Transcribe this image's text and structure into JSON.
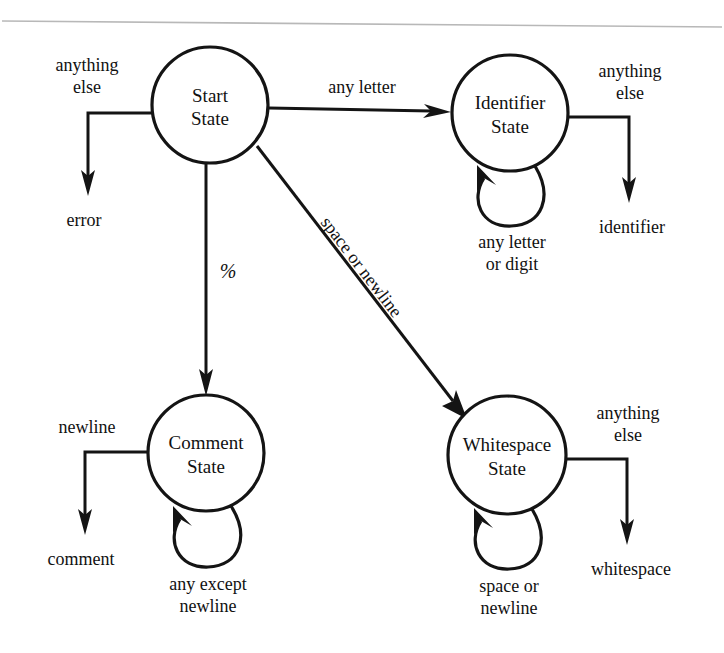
{
  "diagram": {
    "colors": {
      "stroke": "#141414",
      "background": "#ffffff",
      "rule": "#b8b8b8"
    },
    "states": [
      {
        "id": "start",
        "line1": "Start",
        "line2": "State"
      },
      {
        "id": "identifier",
        "line1": "Identifier",
        "line2": "State"
      },
      {
        "id": "comment",
        "line1": "Comment",
        "line2": "State"
      },
      {
        "id": "whitespace",
        "line1": "Whitespace",
        "line2": "State"
      }
    ],
    "transitions": [
      {
        "id": "start-to-error",
        "from": "start",
        "to": "error",
        "label_line1": "anything",
        "label_line2": "else"
      },
      {
        "id": "start-to-identifier",
        "from": "start",
        "to": "identifier",
        "label_line1": "any letter",
        "label_line2": ""
      },
      {
        "id": "start-to-comment",
        "from": "start",
        "to": "comment",
        "label_line1": "%",
        "label_line2": ""
      },
      {
        "id": "start-to-whitespace",
        "from": "start",
        "to": "whitespace",
        "label_line1": "space or",
        "label_line2": "newline"
      },
      {
        "id": "identifier-self-loop",
        "from": "identifier",
        "to": "identifier",
        "label_line1": "any letter",
        "label_line2": "or digit"
      },
      {
        "id": "identifier-to-token",
        "from": "identifier",
        "to": "identifier-token",
        "label_line1": "anything",
        "label_line2": "else"
      },
      {
        "id": "comment-self-loop",
        "from": "comment",
        "to": "comment",
        "label_line1": "any except",
        "label_line2": "newline"
      },
      {
        "id": "comment-to-token",
        "from": "comment",
        "to": "comment-token",
        "label_line1": "newline",
        "label_line2": ""
      },
      {
        "id": "whitespace-self-loop",
        "from": "whitespace",
        "to": "whitespace",
        "label_line1": "space or",
        "label_line2": "newline"
      },
      {
        "id": "whitespace-to-token",
        "from": "whitespace",
        "to": "whitespace-token",
        "label_line1": "anything",
        "label_line2": "else"
      }
    ],
    "outputs": [
      {
        "id": "error",
        "label": "error"
      },
      {
        "id": "identifier-token",
        "label": "identifier"
      },
      {
        "id": "comment-token",
        "label": "comment"
      },
      {
        "id": "whitespace-token",
        "label": "whitespace"
      }
    ],
    "labels": {
      "start_line1": "Start",
      "start_line2": "State",
      "identifier_line1": "Identifier",
      "identifier_line2": "State",
      "comment_line1": "Comment",
      "comment_line2": "State",
      "whitespace_line1": "Whitespace",
      "whitespace_line2": "State",
      "anything_else_1": "anything",
      "anything_else_2": "else",
      "any_letter": "any letter",
      "percent": "%",
      "space_or_newline": "space or newline",
      "any_letter_or_digit_1": "any letter",
      "any_letter_or_digit_2": "or digit",
      "any_except_newline_1": "any except",
      "any_except_newline_2": "newline",
      "space_or_newline_loop_1": "space or",
      "space_or_newline_loop_2": "newline",
      "newline": "newline",
      "id_anything_1": "anything",
      "id_anything_2": "else",
      "ws_anything_1": "anything",
      "ws_anything_2": "else",
      "error": "error",
      "identifier": "identifier",
      "comment": "comment",
      "whitespace": "whitespace"
    }
  }
}
